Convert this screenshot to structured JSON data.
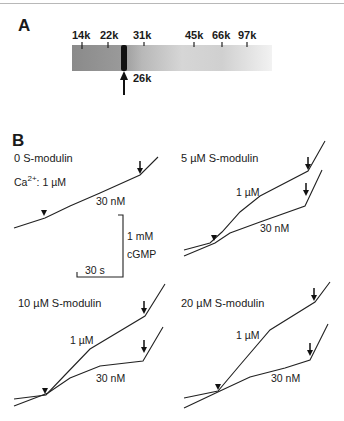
{
  "panel_a": {
    "letter": "A",
    "markers": [
      {
        "label": "14k",
        "x": 82
      },
      {
        "label": "22k",
        "x": 108
      },
      {
        "label": "31k",
        "x": 144
      },
      {
        "label": "45k",
        "x": 194
      },
      {
        "label": "66k",
        "x": 222
      },
      {
        "label": "97k",
        "x": 247
      }
    ],
    "band_label": "26k"
  },
  "panel_b": {
    "letter": "B",
    "subpanels": [
      {
        "title": "0 S-modulin",
        "ca_label": "Ca",
        "ca_sup": "2+",
        "ca_value": ": 1 µM",
        "high_label": "",
        "low_label": "30 nM"
      },
      {
        "title": "5 µM S-modulin",
        "high_label": "1 µM",
        "low_label": "30 nM"
      },
      {
        "title": "10 µM S-modulin",
        "high_label": "1 µM",
        "low_label": "30 nM"
      },
      {
        "title": "20 µM S-modulin",
        "high_label": "1 µM",
        "low_label": "30 nM"
      }
    ],
    "scale_bar": {
      "y_label_1": "1 mM",
      "y_label_2": "cGMP",
      "x_label": "30 s"
    }
  }
}
